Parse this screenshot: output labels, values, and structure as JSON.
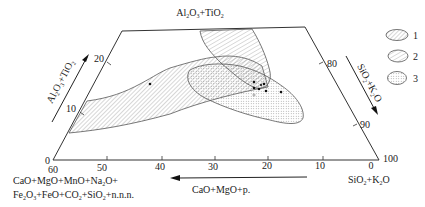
{
  "diagram": {
    "type": "ternary-projection-trapezoid",
    "top_label": "Al2O3+TiO2",
    "left_axis": {
      "label": "Al2O3+TiO2",
      "ticks": [
        "0",
        "10",
        "20"
      ]
    },
    "right_axis": {
      "label": "SiO2+K2O",
      "ticks": [
        "80",
        "90",
        "100"
      ]
    },
    "bottom_axis": {
      "ticks": [
        "60",
        "50",
        "40",
        "30",
        "20",
        "10",
        "0"
      ],
      "arrow_label": "CaO+MgO+p.",
      "left_label_line1": "CaO+MgO+MnO+Na2O+",
      "left_label_line2": "Fe2O3+FeO+CO2+SiO2+n.n.n.",
      "right_label": "SiO2+K2O"
    },
    "legend": [
      {
        "id": "1",
        "label": "1",
        "pattern": "hatch-dense"
      },
      {
        "id": "2",
        "label": "2",
        "pattern": "hatch-sparse"
      },
      {
        "id": "3",
        "label": "3",
        "pattern": "dots"
      }
    ],
    "sample_points_count": 9
  }
}
